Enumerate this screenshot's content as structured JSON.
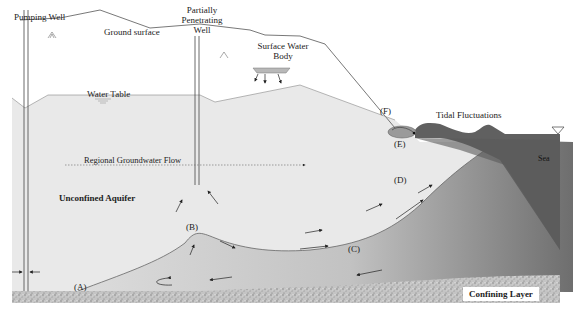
{
  "diagram": {
    "labels": {
      "pumping_well": "Pumping Well",
      "ground_surface": "Ground surface",
      "partially_penetrating_well": [
        "Partially",
        "Penetrating",
        "Well"
      ],
      "surface_water_body": [
        "Surface Water",
        "Body"
      ],
      "water_table": "Water Table",
      "tidal_fluctuations": "Tidal Fluctuations",
      "sea": "Sea",
      "regional_groundwater_flow": "Regional Groundwater Flow",
      "unconfined_aquifer": "Unconfined Aquifer",
      "confining_layer": "Confining Layer"
    },
    "zone_markers": [
      "(A)",
      "(B)",
      "(C)",
      "(D)",
      "(E)",
      "(F)"
    ],
    "colors": {
      "aquifer_fresh": "#e9e9e9",
      "saltwater_wedge_light": "#c8c8c8",
      "saltwater_wedge_dark": "#7a7a7a",
      "sea": "#5e5e5e",
      "confining_layer": "#b5b5b5",
      "lines": "#555555"
    }
  }
}
